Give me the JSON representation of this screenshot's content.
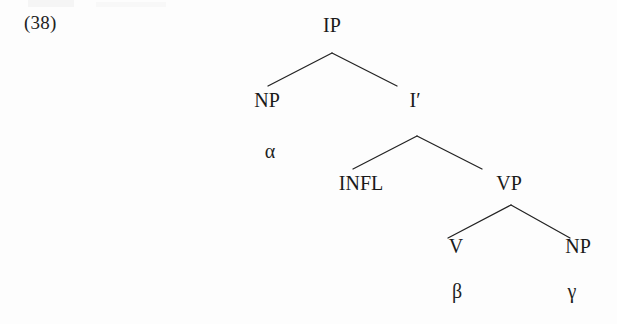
{
  "page": {
    "example_number": "(38)",
    "width": 617,
    "height": 324,
    "background_color": "#fdfdfd",
    "ink_color": "#1a1a1a"
  },
  "tree": {
    "type": "x-bar-syntax-tree",
    "nodes": {
      "ip": {
        "label": "IP",
        "x": 332,
        "y": 15
      },
      "np_subject": {
        "label": "NP",
        "x": 267,
        "y": 90
      },
      "alpha": {
        "label": "α",
        "x": 270,
        "y": 141
      },
      "i_bar": {
        "label": "I′",
        "x": 415,
        "y": 90
      },
      "infl": {
        "label": "INFL",
        "x": 361,
        "y": 173
      },
      "vp": {
        "label": "VP",
        "x": 509,
        "y": 173
      },
      "v": {
        "label": "V",
        "x": 456,
        "y": 236
      },
      "np_object": {
        "label": "NP",
        "x": 578,
        "y": 236
      },
      "beta": {
        "label": "β",
        "x": 457,
        "y": 281
      },
      "gamma": {
        "label": "γ",
        "x": 572,
        "y": 281
      }
    },
    "edges": [
      {
        "from": "ip",
        "to": "np_subject",
        "x1": 332,
        "y1": 53,
        "x2": 268,
        "y2": 86
      },
      {
        "from": "ip",
        "to": "i_bar",
        "x1": 332,
        "y1": 53,
        "x2": 397,
        "y2": 86
      },
      {
        "from": "i_bar",
        "to": "infl",
        "x1": 417,
        "y1": 136,
        "x2": 353,
        "y2": 169
      },
      {
        "from": "i_bar",
        "to": "vp",
        "x1": 417,
        "y1": 136,
        "x2": 482,
        "y2": 169
      },
      {
        "from": "vp",
        "to": "v",
        "x1": 511,
        "y1": 205,
        "x2": 448,
        "y2": 238
      },
      {
        "from": "vp",
        "to": "np_object",
        "x1": 511,
        "y1": 205,
        "x2": 570,
        "y2": 238
      }
    ]
  }
}
